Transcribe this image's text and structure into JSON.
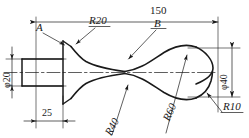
{
  "drawing": {
    "title": "Shaft profile engineering drawing",
    "line_color": "#1a1a1a",
    "background": "#ffffff"
  },
  "dimensions": {
    "overall_length": "150",
    "shaft_length": "25",
    "shaft_diameter": "φ20",
    "head_diameter": "φ40"
  },
  "radii": {
    "r20": "R20",
    "r40": "R40",
    "r60": "R60",
    "r10": "R10"
  },
  "points": {
    "a": "A",
    "b": "B"
  }
}
